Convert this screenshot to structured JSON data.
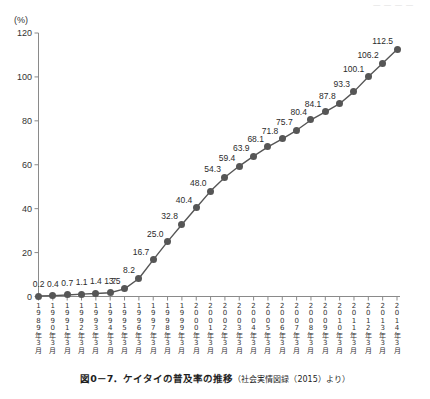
{
  "top_stub": "― ― ― ―",
  "unit_label": "(%)",
  "caption": {
    "main": "図0－7．ケイタイの普及率の推移",
    "source": "（社会実情図録（2015）より）"
  },
  "colors": {
    "marker": "#565656",
    "line": "#565656",
    "axis": "#8a8a8a",
    "text": "#2b2b2b"
  },
  "chart_data": {
    "type": "line",
    "title": "図0－7．ケイタイの普及率の推移",
    "subtitle": "（社会実情図録（2015）より）",
    "xlabel": "",
    "ylabel": "(%)",
    "ylim": [
      0,
      120
    ],
    "yticks": [
      0,
      20,
      40,
      60,
      80,
      100,
      120
    ],
    "grid": false,
    "legend": false,
    "categories": [
      "1989年3月",
      "1990年3月",
      "1991年3月",
      "1992年3月",
      "1993年3月",
      "1994年3月",
      "1995年3月",
      "1996年3月",
      "1997年3月",
      "1998年3月",
      "1999年3月",
      "2000年3月",
      "2001年3月",
      "2002年3月",
      "2003年3月",
      "2004年3月",
      "2005年3月",
      "2006年3月",
      "2007年3月",
      "2008年3月",
      "2009年3月",
      "2010年3月",
      "2011年3月",
      "2012年3月",
      "2013年3月",
      "2014年3月"
    ],
    "category_lines": [
      [
        "1",
        "9",
        "8",
        "9",
        "年",
        "3",
        "月"
      ],
      [
        "1",
        "9",
        "9",
        "0",
        "年",
        "3",
        "月"
      ],
      [
        "1",
        "9",
        "9",
        "1",
        "年",
        "3",
        "月"
      ],
      [
        "1",
        "9",
        "9",
        "2",
        "年",
        "3",
        "月"
      ],
      [
        "1",
        "9",
        "9",
        "3",
        "年",
        "3",
        "月"
      ],
      [
        "1",
        "9",
        "9",
        "4",
        "年",
        "3",
        "月"
      ],
      [
        "1",
        "9",
        "9",
        "5",
        "年",
        "3",
        "月"
      ],
      [
        "1",
        "9",
        "9",
        "6",
        "年",
        "3",
        "月"
      ],
      [
        "1",
        "9",
        "9",
        "7",
        "年",
        "3",
        "月"
      ],
      [
        "1",
        "9",
        "9",
        "8",
        "年",
        "3",
        "月"
      ],
      [
        "1",
        "9",
        "9",
        "9",
        "年",
        "3",
        "月"
      ],
      [
        "2",
        "0",
        "0",
        "0",
        "年",
        "3",
        "月"
      ],
      [
        "2",
        "0",
        "0",
        "1",
        "年",
        "3",
        "月"
      ],
      [
        "2",
        "0",
        "0",
        "2",
        "年",
        "3",
        "月"
      ],
      [
        "2",
        "0",
        "0",
        "3",
        "年",
        "3",
        "月"
      ],
      [
        "2",
        "0",
        "0",
        "4",
        "年",
        "3",
        "月"
      ],
      [
        "2",
        "0",
        "0",
        "5",
        "年",
        "3",
        "月"
      ],
      [
        "2",
        "0",
        "0",
        "6",
        "年",
        "3",
        "月"
      ],
      [
        "2",
        "0",
        "0",
        "7",
        "年",
        "3",
        "月"
      ],
      [
        "2",
        "0",
        "0",
        "8",
        "年",
        "3",
        "月"
      ],
      [
        "2",
        "0",
        "0",
        "9",
        "年",
        "3",
        "月"
      ],
      [
        "2",
        "0",
        "1",
        "0",
        "年",
        "3",
        "月"
      ],
      [
        "2",
        "0",
        "1",
        "1",
        "年",
        "3",
        "月"
      ],
      [
        "2",
        "0",
        "1",
        "2",
        "年",
        "3",
        "月"
      ],
      [
        "2",
        "0",
        "1",
        "3",
        "年",
        "3",
        "月"
      ],
      [
        "2",
        "0",
        "1",
        "4",
        "年",
        "3",
        "月"
      ]
    ],
    "values": [
      0.2,
      0.4,
      0.7,
      1.1,
      1.4,
      1.7,
      3.5,
      8.2,
      16.7,
      25.0,
      32.8,
      40.4,
      48.0,
      54.3,
      59.4,
      63.9,
      68.1,
      71.8,
      75.7,
      80.4,
      84.1,
      87.8,
      93.3,
      100.1,
      106.2,
      112.5
    ],
    "point_labels": [
      "0.2",
      "0.4",
      "0.7",
      "1.1",
      "1.4",
      "1.7",
      "3.5",
      "8.2",
      "16.7",
      "25.0",
      "32.8",
      "40.4",
      "48.0",
      "54.3",
      "59.4",
      "63.9",
      "68.1",
      "71.8",
      "75.7",
      "80.4",
      "84.1",
      "87.8",
      "93.3",
      "100.1",
      "106.2",
      "112.5"
    ]
  }
}
